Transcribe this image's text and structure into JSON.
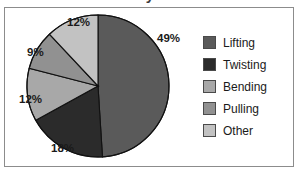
{
  "title": "y",
  "frame": {
    "border_color": "#8c8c8c",
    "background": "#ffffff"
  },
  "chart_data": {
    "type": "pie",
    "title": "",
    "xlabel": "",
    "ylabel": "",
    "legend_position": "right",
    "grid": false,
    "start_angle_deg": 0,
    "direction": "clockwise",
    "categories": [
      "Lifting",
      "Twisting",
      "Bending",
      "Pulling",
      "Other"
    ],
    "values": [
      49,
      18,
      12,
      9,
      12
    ],
    "value_labels": [
      "49%",
      "18%",
      "12%",
      "9%",
      "12%"
    ],
    "colors": [
      "#5a5a5a",
      "#2b2b2b",
      "#a8a8a8",
      "#919191",
      "#c2c2c2"
    ],
    "units": "percent",
    "total": 100
  },
  "slice_labels": [
    {
      "text": "49%",
      "left": 152,
      "top": 24
    },
    {
      "text": "18%",
      "left": 46,
      "top": 134
    },
    {
      "text": "12%",
      "left": 14,
      "top": 85
    },
    {
      "text": "9%",
      "left": 22,
      "top": 38
    },
    {
      "text": "12%",
      "left": 62,
      "top": 8
    }
  ],
  "legend": {
    "items": [
      {
        "label": "Lifting",
        "color": "#5a5a5a"
      },
      {
        "label": "Twisting",
        "color": "#2b2b2b"
      },
      {
        "label": "Bending",
        "color": "#a8a8a8"
      },
      {
        "label": "Pulling",
        "color": "#919191"
      },
      {
        "label": "Other",
        "color": "#c2c2c2"
      }
    ]
  }
}
